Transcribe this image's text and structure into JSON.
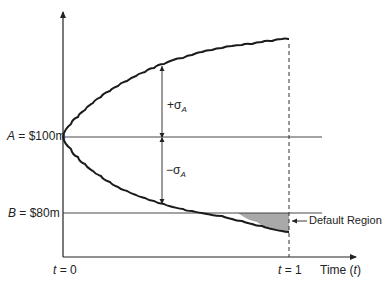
{
  "diagram": {
    "type": "asset-value-paths",
    "labels": {
      "asset_value_prefix": "A",
      "asset_value": " = $100m",
      "barrier_prefix": "B",
      "barrier_value": " = $80m",
      "plus_sigma_sign": "+σ",
      "minus_sigma_sign": "−σ",
      "sigma_sub": "A",
      "t0_prefix": "t",
      "t0_value": " = 0",
      "t1_prefix": "t",
      "t1_value": " = 1",
      "x_axis_label_pre": "Time (",
      "x_axis_label_var": "t",
      "x_axis_label_post": ")",
      "default_region": "Default Region"
    },
    "colors": {
      "line": "#222222",
      "shaded_region": "#a9a9a9"
    }
  }
}
